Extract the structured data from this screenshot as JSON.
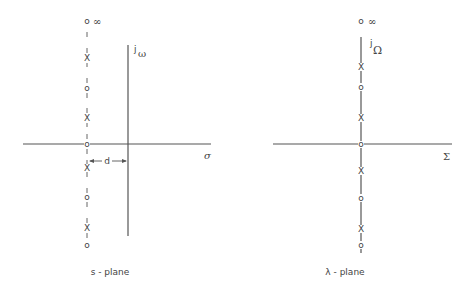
{
  "left_plane": {
    "caption": "s - plane",
    "vertical_axis_label_j": "j",
    "vertical_axis_label_sym": "ω",
    "horizontal_axis_label": "σ",
    "infinity_label": "∞",
    "distance_label": "d",
    "markers": [
      {
        "type": "zero",
        "glyph": "o",
        "y": 21
      },
      {
        "type": "pole",
        "glyph": "X",
        "y": 58
      },
      {
        "type": "zero",
        "glyph": "o",
        "y": 88
      },
      {
        "type": "pole",
        "glyph": "X",
        "y": 118
      },
      {
        "type": "zero",
        "glyph": "o",
        "y": 144
      },
      {
        "type": "pole",
        "glyph": "X",
        "y": 168
      },
      {
        "type": "zero",
        "glyph": "o",
        "y": 197
      },
      {
        "type": "pole",
        "glyph": "X",
        "y": 228
      },
      {
        "type": "zero",
        "glyph": "o",
        "y": 245
      }
    ]
  },
  "right_plane": {
    "caption": "λ - plane",
    "vertical_axis_label_j": "j",
    "vertical_axis_label_sym": "Ω",
    "horizontal_axis_label": "Σ",
    "infinity_label": "∞",
    "markers": [
      {
        "type": "zero",
        "glyph": "o",
        "y": 21
      },
      {
        "type": "pole",
        "glyph": "X",
        "y": 67
      },
      {
        "type": "zero",
        "glyph": "o",
        "y": 87
      },
      {
        "type": "pole",
        "glyph": "X",
        "y": 118
      },
      {
        "type": "zero",
        "glyph": "o",
        "y": 144
      },
      {
        "type": "pole",
        "glyph": "X",
        "y": 171
      },
      {
        "type": "zero",
        "glyph": "o",
        "y": 198
      },
      {
        "type": "pole",
        "glyph": "X",
        "y": 229
      },
      {
        "type": "zero",
        "glyph": "o",
        "y": 245
      }
    ]
  }
}
